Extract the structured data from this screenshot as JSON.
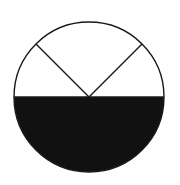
{
  "diagram": {
    "type": "circle-partition",
    "center": [
      89,
      97
    ],
    "radius": 75,
    "stroke_color": "#1a1a1a",
    "fill_shaded": "#111111",
    "fill_unshaded": "#ffffff",
    "sectors": [
      {
        "name": "bottom-half",
        "start_deg": 180,
        "end_deg": 360,
        "angle_deg": 180,
        "shaded": true
      },
      {
        "name": "upper-left",
        "start_deg": 135,
        "end_deg": 180,
        "angle_deg": 45,
        "shaded": false
      },
      {
        "name": "upper-middle",
        "start_deg": 45,
        "end_deg": 135,
        "angle_deg": 90,
        "shaded": false
      },
      {
        "name": "upper-right",
        "start_deg": 0,
        "end_deg": 45,
        "angle_deg": 45,
        "shaded": false
      }
    ]
  }
}
